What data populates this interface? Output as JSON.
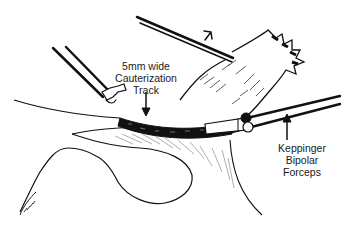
{
  "figure": {
    "type": "medical-illustration",
    "colors": {
      "ink": "#111111",
      "background": "#ffffff",
      "hatch": "#555555"
    }
  },
  "labels": {
    "cauterization_track": {
      "line1": "5mm wide",
      "line2": "Cauterization",
      "line3": "Track"
    },
    "forceps": {
      "line1": "Keppinger",
      "line2": "Bipolar",
      "line3": "Forceps"
    }
  },
  "signature": "artist-signature"
}
